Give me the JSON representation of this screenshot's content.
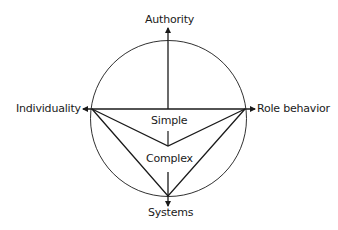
{
  "diagram": {
    "axes": {
      "top": "Authority",
      "left": "Individuality",
      "right": "Role behavior",
      "bottom": "Systems"
    },
    "regions": {
      "inner": "Simple",
      "outer": "Complex"
    },
    "colors": {
      "stroke": "#1a1a1a",
      "background": "#ffffff"
    }
  }
}
